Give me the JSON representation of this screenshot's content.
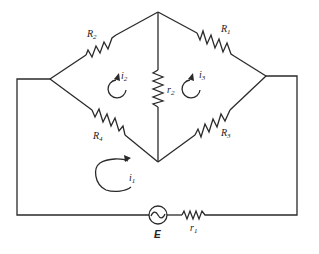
{
  "diagram": {
    "type": "circuit-bridge",
    "resistors": [
      {
        "id": "R2",
        "label": "R",
        "sub": "2"
      },
      {
        "id": "R1",
        "label": "R",
        "sub": "1"
      },
      {
        "id": "R4",
        "label": "R",
        "sub": "4"
      },
      {
        "id": "R3",
        "label": "R",
        "sub": "3"
      },
      {
        "id": "r2",
        "label": "r",
        "sub": "2"
      },
      {
        "id": "r1",
        "label": "r",
        "sub": "1"
      }
    ],
    "loops": [
      {
        "id": "i1",
        "label": "i",
        "sub": "1"
      },
      {
        "id": "i2",
        "label": "i",
        "sub": "2"
      },
      {
        "id": "i3",
        "label": "i",
        "sub": "3"
      }
    ],
    "source": {
      "label": "E",
      "symbol": "~"
    }
  }
}
